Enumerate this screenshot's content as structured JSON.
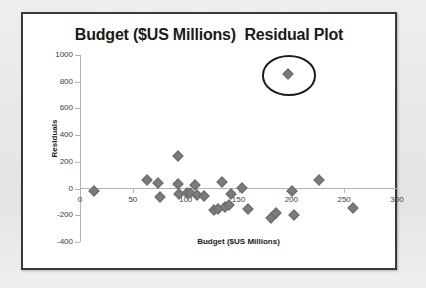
{
  "figure": {
    "title": "Budget ($US Millions)  Residual Plot",
    "frame_color": "#3a3a3a",
    "background": "#ffffff",
    "page_background": "#e9e9e9"
  },
  "chart_data": {
    "type": "scatter",
    "title": "Budget ($US Millions)  Residual Plot",
    "xlabel": "Budget ($US Millions)",
    "ylabel": "Residuals",
    "xlim": [
      0,
      300
    ],
    "ylim": [
      -400,
      1000
    ],
    "xticks": [
      "0",
      "50",
      "100",
      "150",
      "200",
      "250",
      "300"
    ],
    "xtick_values": [
      0,
      50,
      100,
      150,
      200,
      250,
      300
    ],
    "yticks": [
      "1000",
      "800",
      "600",
      "400",
      "200",
      "0",
      "-200",
      "-400"
    ],
    "ytick_values": [
      1000,
      800,
      600,
      400,
      200,
      0,
      -200,
      -400
    ],
    "grid": false,
    "legend": false,
    "marker": "diamond",
    "marker_color": "#7b7b7b",
    "zero_line": true,
    "series": [
      {
        "name": "Residuals",
        "points": [
          {
            "x": 12,
            "y": -10
          },
          {
            "x": 62,
            "y": 68
          },
          {
            "x": 73,
            "y": 48
          },
          {
            "x": 75,
            "y": -57
          },
          {
            "x": 92,
            "y": 248
          },
          {
            "x": 92,
            "y": 42
          },
          {
            "x": 93,
            "y": -30
          },
          {
            "x": 100,
            "y": -25
          },
          {
            "x": 103,
            "y": -28
          },
          {
            "x": 108,
            "y": 33
          },
          {
            "x": 110,
            "y": -40
          },
          {
            "x": 116,
            "y": -50
          },
          {
            "x": 126,
            "y": -152
          },
          {
            "x": 130,
            "y": -145
          },
          {
            "x": 133,
            "y": 58
          },
          {
            "x": 136,
            "y": -128
          },
          {
            "x": 140,
            "y": -115
          },
          {
            "x": 142,
            "y": -33
          },
          {
            "x": 152,
            "y": 10
          },
          {
            "x": 158,
            "y": -143
          },
          {
            "x": 180,
            "y": -215
          },
          {
            "x": 185,
            "y": -172
          },
          {
            "x": 200,
            "y": -12
          },
          {
            "x": 202,
            "y": -192
          },
          {
            "x": 225,
            "y": 72
          },
          {
            "x": 257,
            "y": -140
          },
          {
            "x": 196,
            "y": 862
          }
        ]
      }
    ],
    "annotations": [
      {
        "type": "ellipse",
        "name": "outlier-circle",
        "center_x": 196,
        "center_y": 862,
        "width_units": 48,
        "height_units": 272,
        "color": "#1c1c1c"
      }
    ]
  }
}
